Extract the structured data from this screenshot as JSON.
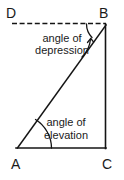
{
  "figure": {
    "background_color": "#ffffff",
    "line_color": "#141414",
    "text_color": "#1a1a1a",
    "vertices": {
      "D": {
        "label": "D",
        "x": 12,
        "y": 23,
        "label_x": 6,
        "label_y": 18
      },
      "B": {
        "label": "B",
        "x": 106,
        "y": 25,
        "label_x": 99,
        "label_y": 18
      },
      "A": {
        "label": "A",
        "x": 17,
        "y": 148,
        "label_x": 11,
        "label_y": 169
      },
      "C": {
        "label": "C",
        "x": 106,
        "y": 148,
        "label_x": 102,
        "label_y": 169
      }
    },
    "segments": [
      {
        "name": "horizontal-dashed-DB",
        "style": "dashed",
        "from": "D",
        "to": "B"
      },
      {
        "name": "hypotenuse-AB",
        "style": "solid",
        "from": "A",
        "to": "B"
      },
      {
        "name": "vertical-BC",
        "style": "solid",
        "from": "B",
        "to": "C"
      },
      {
        "name": "base-AC",
        "style": "solid",
        "from": "A",
        "to": "C"
      }
    ],
    "annotations": {
      "depression": {
        "line1": "angle of",
        "line2": "depression",
        "line1_x": 62,
        "line1_y": 42,
        "line2_x": 62,
        "line2_y": 54,
        "vertex": "B"
      },
      "elevation": {
        "line1": "angle of",
        "line2": "elevation",
        "line1_x": 66,
        "line1_y": 126,
        "line2_x": 66,
        "line2_y": 139,
        "vertex": "A"
      }
    }
  }
}
